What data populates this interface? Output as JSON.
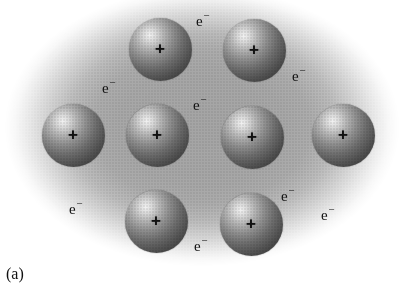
{
  "figure": {
    "caption": "(a)",
    "background_cloud": {
      "name": "electron-sea",
      "center_color": "#a5a5a5",
      "edge_color": "#ffffff"
    },
    "ions": [
      {
        "id": "ion-top-left",
        "charge": "+",
        "cx": 160,
        "cy": 49,
        "d": 63
      },
      {
        "id": "ion-top-right",
        "charge": "+",
        "cx": 254,
        "cy": 50,
        "d": 63
      },
      {
        "id": "ion-mid-far-left",
        "charge": "+",
        "cx": 73,
        "cy": 135,
        "d": 63
      },
      {
        "id": "ion-mid-left",
        "charge": "+",
        "cx": 157,
        "cy": 135,
        "d": 63
      },
      {
        "id": "ion-mid-right",
        "charge": "+",
        "cx": 252,
        "cy": 137,
        "d": 63
      },
      {
        "id": "ion-mid-far-right",
        "charge": "+",
        "cx": 343,
        "cy": 135,
        "d": 63
      },
      {
        "id": "ion-bottom-left",
        "charge": "+",
        "cx": 156,
        "cy": 221,
        "d": 63
      },
      {
        "id": "ion-bottom-right",
        "charge": "+",
        "cx": 251,
        "cy": 224,
        "d": 63
      }
    ],
    "electrons": [
      {
        "id": "electron-top-center",
        "symbol": "e",
        "charge": "−",
        "x": 196,
        "y": 11
      },
      {
        "id": "electron-upper-left",
        "symbol": "e",
        "charge": "−",
        "x": 102,
        "y": 78
      },
      {
        "id": "electron-upper-right",
        "symbol": "e",
        "charge": "−",
        "x": 292,
        "y": 66
      },
      {
        "id": "electron-center",
        "symbol": "e",
        "charge": "−",
        "x": 193,
        "y": 95
      },
      {
        "id": "electron-lower-left",
        "symbol": "e",
        "charge": "−",
        "x": 69,
        "y": 199
      },
      {
        "id": "electron-lower-mid",
        "symbol": "e",
        "charge": "−",
        "x": 281,
        "y": 186
      },
      {
        "id": "electron-lower-right",
        "symbol": "e",
        "charge": "−",
        "x": 321,
        "y": 205
      },
      {
        "id": "electron-bottom",
        "symbol": "e",
        "charge": "−",
        "x": 194,
        "y": 236
      }
    ]
  }
}
